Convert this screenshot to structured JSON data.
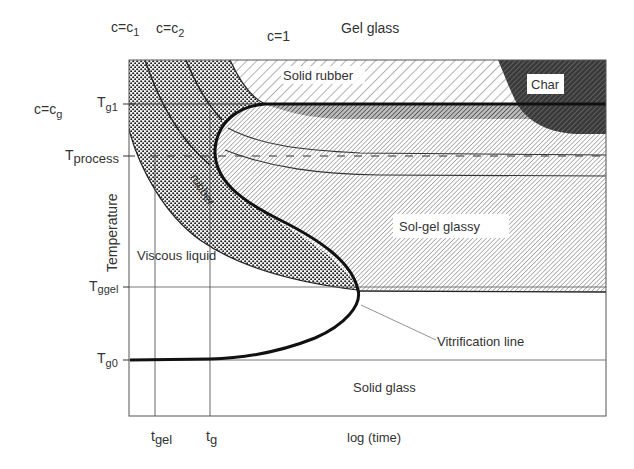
{
  "diagram": {
    "colors": {
      "line": "#111111",
      "thin_line": "#555555",
      "char_fill": "#3a3a3a",
      "hatch": "#555555",
      "dots": "#222222",
      "text": "#333333"
    },
    "top_labels": {
      "c1": {
        "base": "c=c",
        "sub": "1"
      },
      "c2": {
        "base": "c=c",
        "sub": "2"
      },
      "c_one": "c=1",
      "gel_glass": "Gel glass"
    },
    "left_labels": {
      "cg": {
        "base": "c=c",
        "sub": "g"
      },
      "y_axis_title": "Temperature"
    },
    "y_ticks": [
      {
        "id": "tg1",
        "base": "T",
        "sub": "g1"
      },
      {
        "id": "tprocess",
        "base": "T",
        "sub": "process"
      },
      {
        "id": "tggel",
        "base": "T",
        "sub": "ggel"
      },
      {
        "id": "tg0",
        "base": "T",
        "sub": "g0"
      }
    ],
    "x_ticks": [
      {
        "id": "tgel",
        "base": "t",
        "sub": "gel"
      },
      {
        "id": "tg",
        "base": "t",
        "sub": "g"
      }
    ],
    "x_axis_title": "log (time)",
    "regions": {
      "solid_rubber": "Solid rubber",
      "char": "Char",
      "rubber": "rubber",
      "sol_gel_glassy": "Sol-gel glassy",
      "viscous_liquid": "Viscous liquid",
      "solid_glass": "Solid glass"
    },
    "annotations": {
      "vitrification_line": "Vitrification line"
    }
  }
}
